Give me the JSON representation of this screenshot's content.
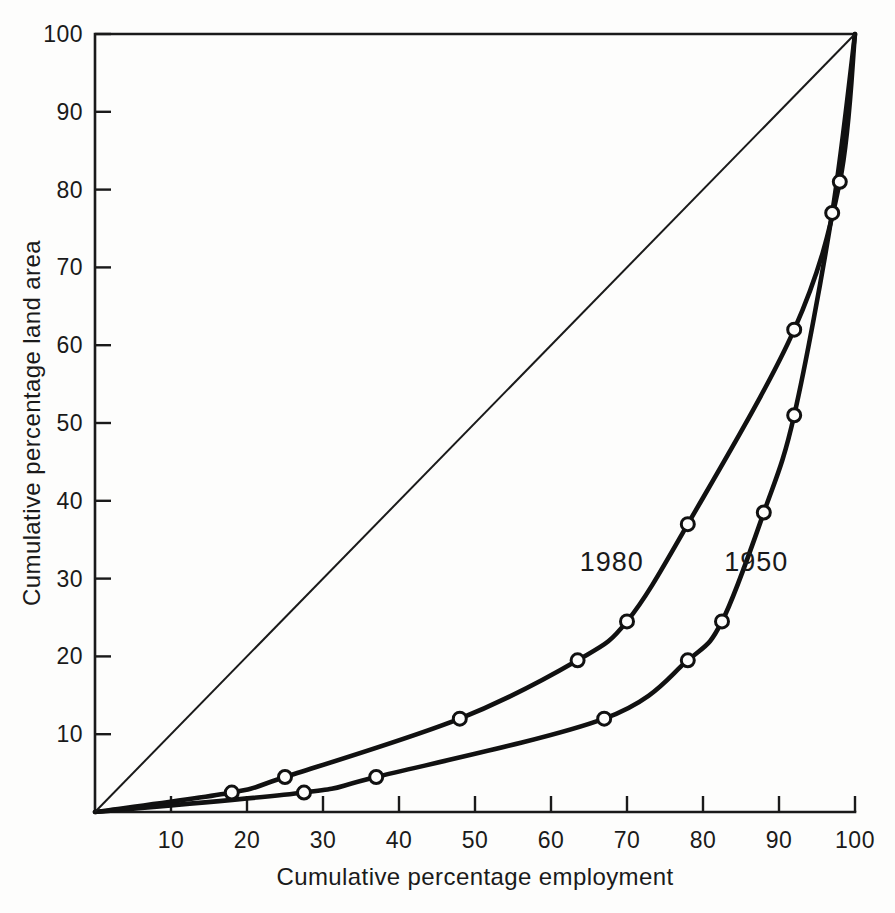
{
  "chart_data": {
    "type": "line",
    "title": "",
    "xlabel": "Cumulative percentage employment",
    "ylabel": "Cumulative percentage land area",
    "xlim": [
      0,
      100
    ],
    "ylim": [
      0,
      100
    ],
    "grid": false,
    "legend_position": "inline-annotation",
    "x_ticks": [
      "10",
      "20",
      "30",
      "40",
      "50",
      "60",
      "70",
      "80",
      "90",
      "100"
    ],
    "x_tick_values": [
      10,
      20,
      30,
      40,
      50,
      60,
      70,
      80,
      90,
      100
    ],
    "y_ticks": [
      "10",
      "20",
      "30",
      "40",
      "50",
      "60",
      "70",
      "80",
      "90",
      "100"
    ],
    "y_tick_values": [
      10,
      20,
      30,
      40,
      50,
      60,
      70,
      80,
      90,
      100
    ],
    "annotations": [
      {
        "text": "1980",
        "x": 68,
        "y": 31
      },
      {
        "text": "1950",
        "x": 87,
        "y": 31
      }
    ],
    "series": [
      {
        "name": "1980",
        "color": "#111111",
        "marker": "open-circle",
        "points": [
          {
            "x": 0,
            "y": 0
          },
          {
            "x": 18,
            "y": 2.5
          },
          {
            "x": 25,
            "y": 4.5
          },
          {
            "x": 48,
            "y": 12
          },
          {
            "x": 63.5,
            "y": 19.5
          },
          {
            "x": 70,
            "y": 24.5
          },
          {
            "x": 78,
            "y": 37
          },
          {
            "x": 92,
            "y": 62
          },
          {
            "x": 98,
            "y": 81
          },
          {
            "x": 100,
            "y": 100
          }
        ]
      },
      {
        "name": "1950",
        "color": "#111111",
        "marker": "open-circle",
        "points": [
          {
            "x": 0,
            "y": 0
          },
          {
            "x": 27.5,
            "y": 2.5
          },
          {
            "x": 37,
            "y": 4.5
          },
          {
            "x": 67,
            "y": 12
          },
          {
            "x": 78,
            "y": 19.5
          },
          {
            "x": 82.5,
            "y": 24.5
          },
          {
            "x": 88,
            "y": 38.5
          },
          {
            "x": 92,
            "y": 51
          },
          {
            "x": 97,
            "y": 77
          },
          {
            "x": 100,
            "y": 100
          }
        ]
      },
      {
        "name": "line-of-equality",
        "color": "#1a1a1a",
        "marker": "none",
        "points": [
          {
            "x": 0,
            "y": 0
          },
          {
            "x": 100,
            "y": 100
          }
        ]
      }
    ]
  }
}
